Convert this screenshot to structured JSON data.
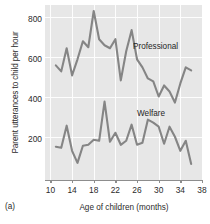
{
  "panel_label": "(a)",
  "axes": {
    "ylabel": "Parent utterances to child per hour",
    "xlabel": "Age of children (months)",
    "yticks": [
      200,
      400,
      600,
      800
    ],
    "xticks": [
      10,
      14,
      18,
      22,
      26,
      30,
      34,
      38
    ]
  },
  "colors": {
    "plot_background": "#e7e7e7",
    "gridline": "#fdfdfd",
    "series_line": "#858585",
    "axis_line": "#8d8d8d",
    "text": "#2b2b2b"
  },
  "chart_data": {
    "type": "line",
    "title": "",
    "subtitle": "",
    "xlabel": "Age of children (months)",
    "ylabel": "Parent utterances to child per hour",
    "xlim": [
      9,
      38
    ],
    "ylim": [
      0,
      870
    ],
    "grid": true,
    "legend": "inline-annotation",
    "x": [
      11,
      12,
      13,
      14,
      15,
      16,
      17,
      18,
      19,
      20,
      21,
      22,
      23,
      24,
      25,
      26,
      27,
      28,
      29,
      30,
      31,
      32,
      33,
      34,
      35,
      36
    ],
    "series": [
      {
        "name": "Professional",
        "label_position": "upper-right",
        "color": "#858585",
        "values": [
          570,
          540,
          655,
          520,
          600,
          690,
          660,
          840,
          700,
          670,
          655,
          700,
          495,
          640,
          745,
          600,
          560,
          505,
          490,
          415,
          470,
          440,
          385,
          480,
          560,
          545
        ]
      },
      {
        "name": "Welfare",
        "label_position": "mid-right",
        "color": "#858585",
        "values": [
          165,
          160,
          270,
          145,
          85,
          170,
          175,
          200,
          195,
          390,
          190,
          235,
          175,
          195,
          275,
          175,
          185,
          300,
          285,
          265,
          180,
          265,
          215,
          145,
          195,
          80
        ]
      }
    ],
    "annotations": [
      {
        "text": "Professional",
        "x": 26,
        "y": 700
      },
      {
        "text": "Welfare",
        "x": 27,
        "y": 330
      }
    ]
  }
}
